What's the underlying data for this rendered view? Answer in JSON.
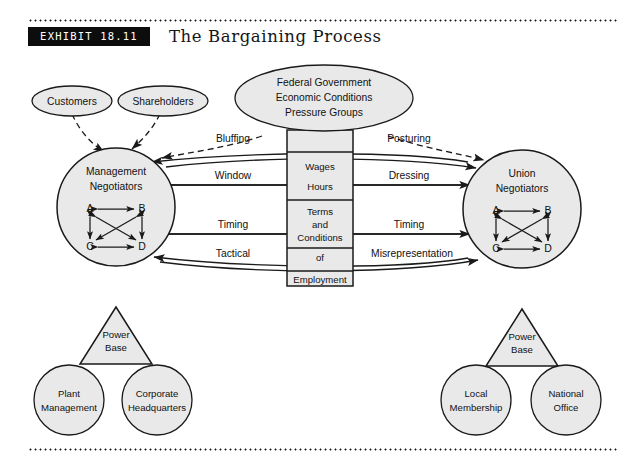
{
  "header": {
    "exhibit_label": "EXHIBIT 18.11",
    "title": "The Bargaining Process"
  },
  "diagram": {
    "external_influences": {
      "customers": "Customers",
      "shareholders": "Shareholders",
      "federal": {
        "line1": "Federal Government",
        "line2": "Economic Conditions",
        "line3": "Pressure Groups"
      }
    },
    "management": {
      "title_line1": "Management",
      "title_line2": "Negotiators",
      "members": [
        "A",
        "B",
        "C",
        "D"
      ],
      "power_base_line1": "Power",
      "power_base_line2": "Base",
      "supports": [
        {
          "line1": "Plant",
          "line2": "Management"
        },
        {
          "line1": "Corporate",
          "line2": "Headquarters"
        }
      ]
    },
    "union": {
      "title_line1": "Union",
      "title_line2": "Negotiators",
      "members": [
        "A",
        "B",
        "C",
        "D"
      ],
      "power_base_line1": "Power",
      "power_base_line2": "Base",
      "supports": [
        {
          "line1": "Local",
          "line2": "Membership"
        },
        {
          "line1": "National",
          "line2": "Office"
        }
      ]
    },
    "subject_box": {
      "row1_line1": "Wages",
      "row1_line2": "Hours",
      "row2_line1": "Terms",
      "row2_line2": "and",
      "row2_line3": "Conditions",
      "row3_line1": "of",
      "row3_line2": "Employment"
    },
    "tactics_left": [
      "Bluffing",
      "Window",
      "Timing",
      "Tactical"
    ],
    "tactics_right": [
      "Posturing",
      "Dressing",
      "Timing",
      "Misrepresentation"
    ]
  },
  "colors": {
    "shape_fill": "#e9e9e9",
    "stroke": "#1a1a1a",
    "badge_bg": "#0d0d0d",
    "badge_text": "#ffffff",
    "page_bg": "#ffffff"
  }
}
